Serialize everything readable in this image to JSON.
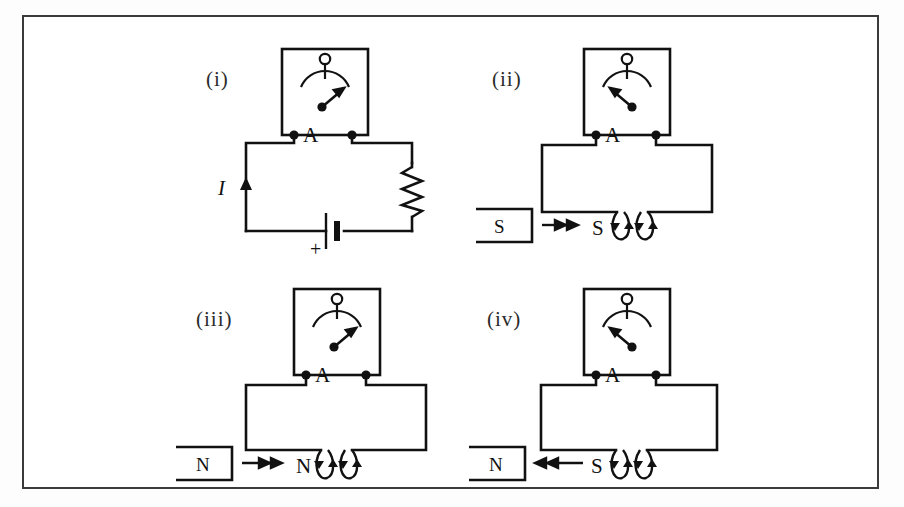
{
  "figure": {
    "frame_color": "#3b3b3b",
    "ink_color": "#111111",
    "background": "#ffffff"
  },
  "panels": [
    {
      "id": "panel-i",
      "label": "(i)",
      "type": "battery-circuit",
      "meter": {
        "terminal_label": "A",
        "needle_direction": "right",
        "needle_angle_deg": 40
      },
      "components": {
        "current_label": "I",
        "current_arrow_direction": "up",
        "battery_polarity_label": "+",
        "resistor": "zigzag-resistor"
      }
    },
    {
      "id": "panel-ii",
      "label": "(ii)",
      "type": "coil-magnet",
      "meter": {
        "terminal_label": "A",
        "needle_direction": "left",
        "needle_angle_deg": -40
      },
      "magnet": {
        "pole_label": "S",
        "motion_direction": "right",
        "motion": "toward-coil"
      },
      "coil": {
        "near_end_label": "S",
        "turns": 2,
        "current_arrow_direction": "down-left"
      }
    },
    {
      "id": "panel-iii",
      "label": "(iii)",
      "type": "coil-magnet",
      "meter": {
        "terminal_label": "A",
        "needle_direction": "right",
        "needle_angle_deg": 40
      },
      "magnet": {
        "pole_label": "N",
        "motion_direction": "right",
        "motion": "toward-coil"
      },
      "coil": {
        "near_end_label": "N",
        "turns": 2,
        "current_arrow_direction": "down-left"
      }
    },
    {
      "id": "panel-iv",
      "label": "(iv)",
      "type": "coil-magnet",
      "meter": {
        "terminal_label": "A",
        "needle_direction": "left",
        "needle_angle_deg": -40
      },
      "magnet": {
        "pole_label": "N",
        "motion_direction": "left",
        "motion": "away-from-coil"
      },
      "coil": {
        "near_end_label": "S",
        "turns": 2,
        "current_arrow_direction": "down-left"
      }
    }
  ]
}
